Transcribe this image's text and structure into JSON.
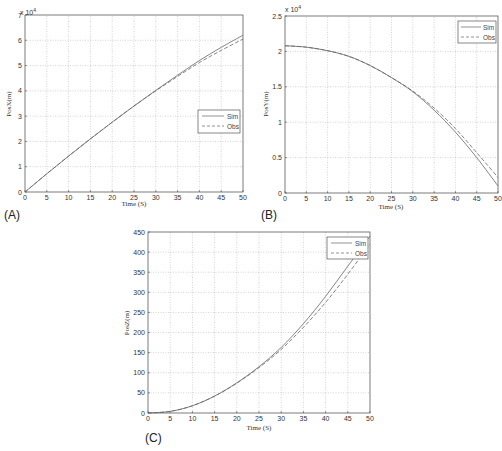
{
  "chart_data": [
    {
      "panel": "(A)",
      "type": "line",
      "title": "",
      "xlabel": "Time (S)",
      "ylabel": "PosX(m)",
      "y_multiplier": "x 10^4",
      "xlim": [
        0,
        50
      ],
      "ylim": [
        0,
        7
      ],
      "xticks": [
        0,
        5,
        10,
        15,
        20,
        25,
        30,
        35,
        40,
        45,
        50
      ],
      "yticks": [
        0,
        1,
        2,
        3,
        4,
        5,
        6,
        7
      ],
      "grid": true,
      "legend_position": "center right",
      "x": [
        0,
        5,
        10,
        15,
        20,
        25,
        30,
        35,
        40,
        45,
        50
      ],
      "series": [
        {
          "name": "Sim",
          "style": "solid",
          "values": [
            0,
            0.72,
            1.42,
            2.1,
            2.76,
            3.4,
            4.02,
            4.62,
            5.2,
            5.72,
            6.2
          ]
        },
        {
          "name": "Obs",
          "style": "dashed",
          "values": [
            0,
            0.72,
            1.42,
            2.1,
            2.76,
            3.4,
            4.0,
            4.57,
            5.12,
            5.6,
            6.05
          ]
        }
      ]
    },
    {
      "panel": "(B)",
      "type": "line",
      "title": "",
      "xlabel": "Time (S)",
      "ylabel": "PosY(m)",
      "y_multiplier": "x 10^4",
      "xlim": [
        0,
        50
      ],
      "ylim": [
        0,
        2.5
      ],
      "xticks": [
        0,
        5,
        10,
        15,
        20,
        25,
        30,
        35,
        40,
        45,
        50
      ],
      "yticks": [
        0,
        0.5,
        1,
        1.5,
        2,
        2.5
      ],
      "grid": true,
      "legend_position": "upper right",
      "x": [
        0,
        5,
        10,
        15,
        20,
        25,
        30,
        35,
        40,
        45,
        50
      ],
      "series": [
        {
          "name": "Sim",
          "style": "solid",
          "values": [
            2.08,
            2.06,
            2.01,
            1.93,
            1.8,
            1.63,
            1.43,
            1.17,
            0.86,
            0.5,
            0.1
          ]
        },
        {
          "name": "Obs",
          "style": "dashed",
          "values": [
            2.08,
            2.06,
            2.01,
            1.93,
            1.8,
            1.63,
            1.44,
            1.2,
            0.91,
            0.57,
            0.22
          ]
        }
      ]
    },
    {
      "panel": "(C)",
      "type": "line",
      "title": "",
      "xlabel": "Time (S)",
      "ylabel": "PosZ(m)",
      "xlim": [
        0,
        50
      ],
      "ylim": [
        0,
        450
      ],
      "xticks": [
        0,
        5,
        10,
        15,
        20,
        25,
        30,
        35,
        40,
        45,
        50
      ],
      "yticks": [
        0,
        50,
        100,
        150,
        200,
        250,
        300,
        350,
        400,
        450
      ],
      "grid": true,
      "legend_position": "upper right",
      "x": [
        0,
        5,
        10,
        15,
        20,
        25,
        30,
        35,
        40,
        45,
        50
      ],
      "series": [
        {
          "name": "Sim",
          "style": "solid",
          "values": [
            0,
            4,
            18,
            42,
            75,
            115,
            163,
            222,
            290,
            365,
            440
          ]
        },
        {
          "name": "Obs",
          "style": "dashed",
          "values": [
            0,
            4,
            18,
            42,
            74,
            113,
            158,
            213,
            275,
            345,
            420
          ]
        }
      ]
    }
  ],
  "labels": {
    "a": {
      "panel": "(A)",
      "xlabel": "Time (S)",
      "ylabel": "PosX(m)",
      "mult": "x 10",
      "exp": "4",
      "leg_sim": "Sim",
      "leg_obs": "Obs"
    },
    "b": {
      "panel": "(B)",
      "xlabel": "Time (S)",
      "ylabel": "PosY(m)",
      "mult": "x 10",
      "exp": "4",
      "leg_sim": "Sim",
      "leg_obs": "Obs"
    },
    "c": {
      "panel": "(C)",
      "xlabel": "Time (S)",
      "ylabel": "PosZ(m)",
      "leg_sim": "Sim",
      "leg_obs": "Obs"
    }
  }
}
